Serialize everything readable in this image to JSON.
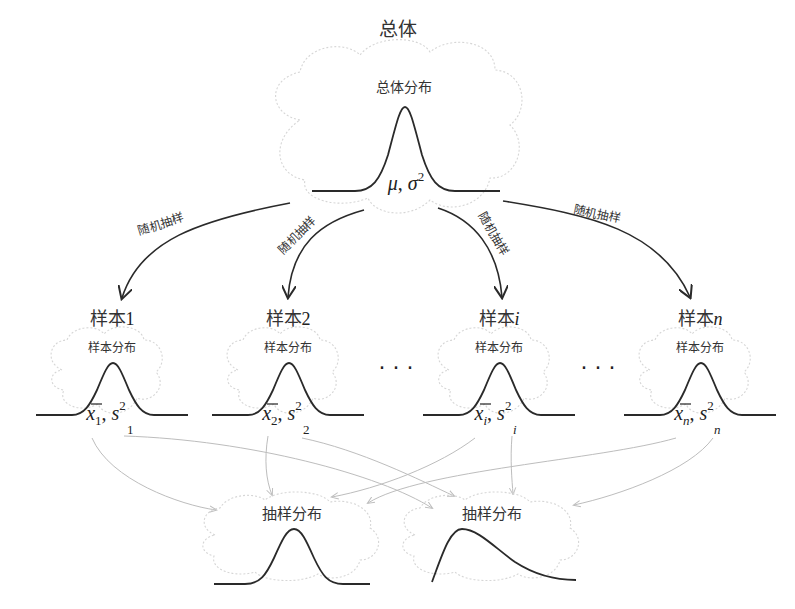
{
  "population": {
    "title": "总体",
    "cloud_label": "总体分布",
    "params_mu": "μ",
    "params_sep": ",",
    "params_sigma": "σ",
    "params_sigma_exp": "2"
  },
  "sampling_arrow_label": "随机抽样",
  "arrows": [
    {
      "label": "随机抽样",
      "target": "样本1"
    },
    {
      "label": "随机抽样",
      "target": "样本2"
    },
    {
      "label": "随机抽样",
      "target": "样本i"
    },
    {
      "label": "随机抽样",
      "target": "样本n"
    }
  ],
  "samples": [
    {
      "title_prefix": "样本",
      "title_index": "1",
      "index_italic": false,
      "cloud_label": "样本分布",
      "mean_sym": "x",
      "sub": "1",
      "var_sym": "s",
      "var_exp": "2"
    },
    {
      "title_prefix": "样本",
      "title_index": "2",
      "index_italic": false,
      "cloud_label": "样本分布",
      "mean_sym": "x",
      "sub": "2",
      "var_sym": "s",
      "var_exp": "2"
    },
    {
      "title_prefix": "样本",
      "title_index": "i",
      "index_italic": true,
      "cloud_label": "样本分布",
      "mean_sym": "x",
      "sub": "i",
      "var_sym": "s",
      "var_exp": "2"
    },
    {
      "title_prefix": "样本",
      "title_index": "n",
      "index_italic": true,
      "cloud_label": "样本分布",
      "mean_sym": "x",
      "sub": "n",
      "var_sym": "s",
      "var_exp": "2"
    }
  ],
  "ellipsis": [
    "· · ·",
    "· · ·"
  ],
  "sampling_distributions": [
    {
      "label": "抽样分布",
      "shape": "symmetric-normal"
    },
    {
      "label": "抽样分布",
      "shape": "right-skewed"
    }
  ],
  "colors": {
    "curve": "#2a2a2a",
    "cloud_outline": "#d6d6d6",
    "grey_arrow": "#bdbdbd",
    "text": "#333333"
  }
}
